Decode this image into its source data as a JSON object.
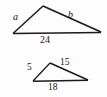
{
  "figure": {
    "kind": "similar-triangles-diagram",
    "background_color": "#fdfdfd",
    "stroke_color": "#1a1a1a",
    "triangles": [
      {
        "id": "large-triangle",
        "name": "upper-triangle",
        "vertices": {
          "left": [
            13,
            33
          ],
          "apex": [
            43,
            6
          ],
          "right": [
            101,
            32
          ]
        },
        "labels": {
          "left_side": "a",
          "right_side": "b",
          "base": "24"
        },
        "label_styles": {
          "left_side": "italic",
          "right_side": "italic",
          "base": "roman"
        }
      },
      {
        "id": "small-triangle",
        "name": "lower-triangle",
        "vertices": {
          "left": [
            33,
            81
          ],
          "apex": [
            50,
            63
          ],
          "right": [
            88,
            80
          ]
        },
        "labels": {
          "left_side": "5",
          "right_side": "15",
          "base": "18"
        },
        "label_styles": {
          "left_side": "roman",
          "right_side": "roman",
          "base": "roman"
        }
      }
    ]
  }
}
